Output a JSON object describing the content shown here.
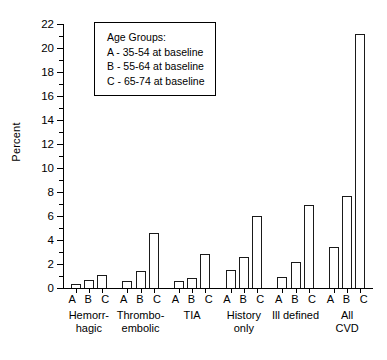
{
  "chart_data": {
    "type": "bar",
    "title": "",
    "xlabel": "",
    "ylabel": "Percent",
    "ylim": [
      0,
      22
    ],
    "ytick_step": 2,
    "yticks": [
      0,
      2,
      4,
      6,
      8,
      10,
      12,
      14,
      16,
      18,
      20,
      22
    ],
    "ytick_labels": [
      "0",
      "2",
      "4",
      "6",
      "8",
      "10",
      "12",
      "14",
      "16",
      "18",
      "20",
      "22"
    ],
    "minor_ticks": true,
    "grid": false,
    "legend_position": "upper-left-inside",
    "categories": [
      "Hemorr-\nhagic",
      "Thrombo-\nembolic",
      "TIA",
      "History\nonly",
      "Ill defined",
      "All\nCVD"
    ],
    "group_tick_labels": [
      "A",
      "B",
      "C"
    ],
    "series": [
      {
        "name": "A - 35-54 at baseline",
        "values": [
          0.3,
          0.6,
          0.6,
          1.5,
          0.9,
          3.4
        ]
      },
      {
        "name": "B - 55-64 at baseline",
        "values": [
          0.7,
          1.4,
          0.8,
          2.6,
          2.2,
          7.7
        ]
      },
      {
        "name": "C - 65-74 at baseline",
        "values": [
          1.1,
          4.6,
          2.8,
          6.0,
          6.9,
          21.2
        ]
      }
    ],
    "bar_facecolor": "#ffffff",
    "bar_edgecolor": "#1a1a1a"
  },
  "legend": {
    "title": "Age Groups:",
    "items": [
      "A - 35-54 at baseline",
      "B - 55-64 at baseline",
      "C - 65-74 at baseline"
    ]
  },
  "groups": [
    {
      "abc": "A B C",
      "line1": "Hemorr-",
      "line2": "hagic"
    },
    {
      "abc": "A B C",
      "line1": "Thrombo-",
      "line2": "embolic"
    },
    {
      "abc": "A B C",
      "line1": "TIA",
      "line2": ""
    },
    {
      "abc": "A B C",
      "line1": "History",
      "line2": "only"
    },
    {
      "abc": "A B C",
      "line1": "Ill defined",
      "line2": ""
    },
    {
      "abc": "A B C",
      "line1": "All",
      "line2": "CVD"
    }
  ]
}
